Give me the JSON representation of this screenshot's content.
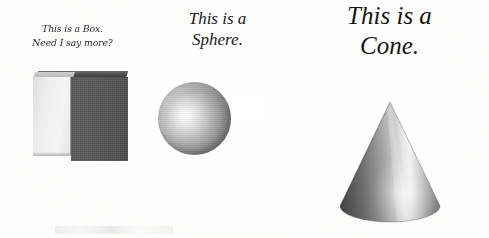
{
  "figure": {
    "background_color": "#fdfdfc",
    "ink_color": "#1d1d1d",
    "panels": [
      {
        "id": "box",
        "caption": "This is a Box.\nNeed I say more?",
        "shape_name": "box",
        "shape_label": "cube",
        "colors": {
          "left_face": "#efefef",
          "right_face": "#555555",
          "top_face": "#4a4a4a"
        }
      },
      {
        "id": "sphere",
        "caption": "This is a\nSphere.",
        "shape_name": "sphere",
        "shape_label": "sphere",
        "colors": {
          "highlight": "#fdfdfd",
          "midtone": "#a6a6a6",
          "shadow": "#696969"
        }
      },
      {
        "id": "cone",
        "caption": "This is a\nCone.",
        "shape_name": "cone",
        "shape_label": "cone",
        "colors": {
          "highlight": "#f2f2f2",
          "midtone": "#9b9b9b",
          "shadow": "#4d4d4d"
        }
      }
    ]
  },
  "shapes": {
    "box": {
      "type": "cube",
      "apex_note": "axonometric cube, light left face, dark right face, thin dark top"
    },
    "sphere": {
      "type": "sphere",
      "highlight_position": "upper-left-of-center"
    },
    "cone": {
      "type": "cone",
      "apex": "top-center",
      "base": "ellipse",
      "highlight_position": "center-right"
    }
  }
}
